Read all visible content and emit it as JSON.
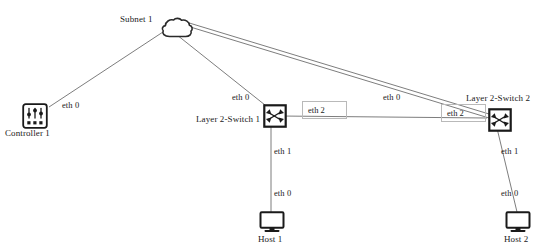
{
  "diagram": {
    "background_color": "#ffffff",
    "line_color": "#6e6e6e",
    "icon_stroke_color": "#1a1a1a",
    "label_color": "#1a1a1a",
    "eth_box_border_color": "#b9b9b9"
  },
  "nodes": [
    {
      "id": "subnet1",
      "label": "Subnet 1",
      "icon": "cloud-icon",
      "x": 160,
      "y": 17,
      "label_x": 120,
      "label_y": 14
    },
    {
      "id": "controller1",
      "label": "Controller 1",
      "icon": "controller-icon",
      "x": 22,
      "y": 103,
      "label_x": 5,
      "label_y": 128
    },
    {
      "id": "switch1",
      "label": "Layer 2-Switch 1",
      "icon": "switch-icon",
      "x": 263,
      "y": 104,
      "label_x": 196,
      "label_y": 114
    },
    {
      "id": "switch2",
      "label": "Layer 2-Switch 2",
      "icon": "switch-icon",
      "x": 488,
      "y": 108,
      "label_x": 466,
      "label_y": 93
    },
    {
      "id": "host1",
      "label": "Host 1",
      "icon": "host-icon",
      "x": 259,
      "y": 211,
      "label_x": 258,
      "label_y": 234
    },
    {
      "id": "host2",
      "label": "Host 2",
      "icon": "host-icon",
      "x": 505,
      "y": 211,
      "label_x": 504,
      "label_y": 234
    }
  ],
  "links": [
    {
      "id": "subnet-controller",
      "from": "subnet1",
      "to": "controller1",
      "x1": 166,
      "y1": 30,
      "x2": 49,
      "y2": 107
    },
    {
      "id": "subnet-switch1",
      "from": "subnet1",
      "to": "switch1",
      "x1": 172,
      "y1": 31,
      "x2": 265,
      "y2": 105
    },
    {
      "id": "subnet-switch2-a",
      "from": "subnet1",
      "to": "switch2",
      "x1": 186,
      "y1": 22,
      "x2": 489,
      "y2": 114
    },
    {
      "id": "subnet-switch2-b",
      "from": "subnet1",
      "to": "switch2",
      "x1": 187,
      "y1": 26,
      "x2": 489,
      "y2": 118
    },
    {
      "id": "switch1-switch2",
      "from": "switch1",
      "to": "switch2",
      "x1": 280,
      "y1": 116,
      "x2": 487,
      "y2": 118
    },
    {
      "id": "switch1-host1",
      "from": "switch1",
      "to": "host1",
      "x1": 271,
      "y1": 120,
      "x2": 271,
      "y2": 212
    },
    {
      "id": "switch2-host2",
      "from": "switch2",
      "to": "host2",
      "x1": 496,
      "y1": 124,
      "x2": 517,
      "y2": 212
    }
  ],
  "port_labels": [
    {
      "id": "eth0-controller",
      "text": "eth 0",
      "x": 62,
      "y": 100
    },
    {
      "id": "eth0-switch1",
      "text": "eth 0",
      "x": 232,
      "y": 92
    },
    {
      "id": "eth0-switch2",
      "text": "eth 0",
      "x": 383,
      "y": 92
    },
    {
      "id": "eth1-switch1",
      "text": "eth 1",
      "x": 274,
      "y": 146
    },
    {
      "id": "eth0-host1",
      "text": "eth 0",
      "x": 274,
      "y": 188
    },
    {
      "id": "eth1-switch2",
      "text": "eth 1",
      "x": 501,
      "y": 146
    },
    {
      "id": "eth0-host2",
      "text": "eth 0",
      "x": 501,
      "y": 188
    }
  ],
  "port_boxes": [
    {
      "id": "eth2-left",
      "text": "eth 2",
      "x": 302,
      "y": 101,
      "w": 45,
      "h": 18
    },
    {
      "id": "eth2-right",
      "text": "eth 2",
      "x": 441,
      "y": 104,
      "w": 45,
      "h": 18
    }
  ]
}
